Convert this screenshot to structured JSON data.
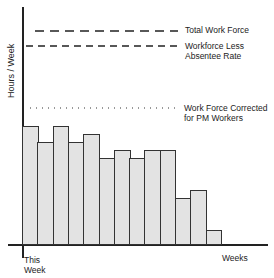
{
  "chart_data": {
    "type": "bar",
    "title": "",
    "xlabel": "Weeks",
    "ylabel": "Hours / Week",
    "x_start_label": "This Week",
    "categories": [
      "W1",
      "W2",
      "W3",
      "W4",
      "W5",
      "W6",
      "W7",
      "W8",
      "W9",
      "W10",
      "W11",
      "W12",
      "W13"
    ],
    "values": [
      119,
      103,
      119,
      103,
      111,
      87,
      95,
      87,
      95,
      95,
      47,
      55,
      15
    ],
    "value_units": "relative (px above baseline, unlabeled axis)",
    "reference_lines": [
      {
        "name": "Total Work Force",
        "style": "long-dash",
        "value": 213
      },
      {
        "name": "Workforce Less Absentee Rate",
        "style": "dash",
        "value": 198
      },
      {
        "name": "Work Force Corrected for PM Workers",
        "style": "dotted",
        "value": 136
      }
    ],
    "grid": false,
    "legend_position": "right, inline labels"
  },
  "labels": {
    "ylabel": "Hours / Week",
    "xlabel": "Weeks",
    "this_week_1": "This",
    "this_week_2": "Week",
    "total": "Total Work Force",
    "absentee_1": "Workforce Less",
    "absentee_2": "Absentee Rate",
    "pm_1": "Work Force Corrected",
    "pm_2": "for PM Workers"
  }
}
